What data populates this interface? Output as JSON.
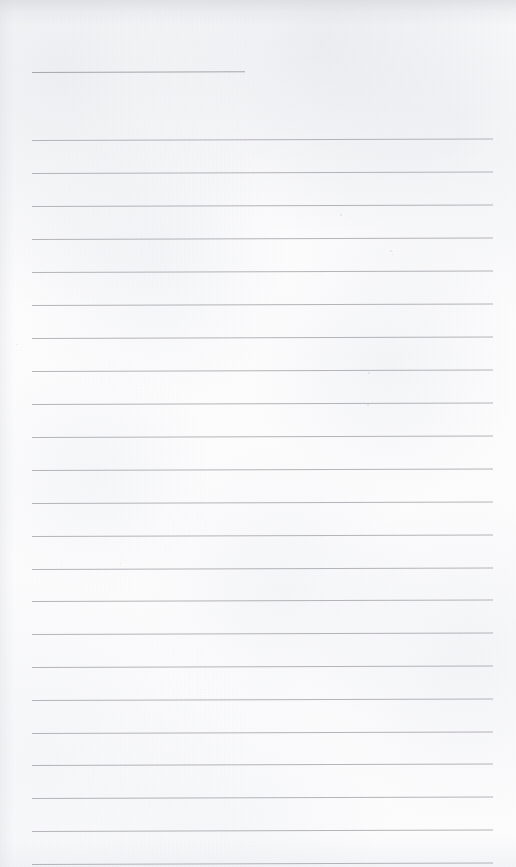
{
  "document": {
    "kind": "scanned-ruled-notepaper",
    "title": "",
    "visible_text": "",
    "text_content_present": false,
    "page_width": 516,
    "page_height": 867,
    "paper_color": "#fcfcfd",
    "rule_color": "#a8a8ad",
    "header_rule_color": "#9fa0a5",
    "scan_skew_px": -1.6
  },
  "rules": {
    "count": 24,
    "full_left_x": 32,
    "full_right_x": 493,
    "spacing_px": 33,
    "thickness_px": 1,
    "items": [
      {
        "index": 1,
        "y": 72,
        "x": 32,
        "width": 213,
        "kind": "header-rule",
        "label": ""
      },
      {
        "index": 2,
        "y": 140,
        "x": 32,
        "width": 461,
        "kind": "body-rule",
        "label": ""
      },
      {
        "index": 3,
        "y": 173,
        "x": 32,
        "width": 461,
        "kind": "body-rule",
        "label": ""
      },
      {
        "index": 4,
        "y": 206,
        "x": 32,
        "width": 461,
        "kind": "body-rule",
        "label": ""
      },
      {
        "index": 5,
        "y": 239,
        "x": 32,
        "width": 461,
        "kind": "body-rule",
        "label": ""
      },
      {
        "index": 6,
        "y": 272,
        "x": 32,
        "width": 461,
        "kind": "body-rule",
        "label": ""
      },
      {
        "index": 7,
        "y": 305,
        "x": 32,
        "width": 461,
        "kind": "body-rule",
        "label": ""
      },
      {
        "index": 8,
        "y": 338,
        "x": 32,
        "width": 461,
        "kind": "body-rule",
        "label": ""
      },
      {
        "index": 9,
        "y": 371,
        "x": 32,
        "width": 461,
        "kind": "body-rule",
        "label": ""
      },
      {
        "index": 10,
        "y": 404,
        "x": 32,
        "width": 461,
        "kind": "body-rule",
        "label": ""
      },
      {
        "index": 11,
        "y": 437,
        "x": 32,
        "width": 461,
        "kind": "body-rule",
        "label": ""
      },
      {
        "index": 12,
        "y": 470,
        "x": 32,
        "width": 461,
        "kind": "body-rule",
        "label": ""
      },
      {
        "index": 13,
        "y": 503,
        "x": 32,
        "width": 461,
        "kind": "body-rule",
        "label": ""
      },
      {
        "index": 14,
        "y": 536,
        "x": 32,
        "width": 461,
        "kind": "body-rule",
        "label": ""
      },
      {
        "index": 15,
        "y": 569,
        "x": 32,
        "width": 461,
        "kind": "body-rule",
        "label": ""
      },
      {
        "index": 16,
        "y": 601,
        "x": 32,
        "width": 461,
        "kind": "body-rule",
        "label": ""
      },
      {
        "index": 17,
        "y": 634,
        "x": 32,
        "width": 461,
        "kind": "body-rule",
        "label": ""
      },
      {
        "index": 18,
        "y": 667,
        "x": 32,
        "width": 461,
        "kind": "body-rule",
        "label": ""
      },
      {
        "index": 19,
        "y": 700,
        "x": 32,
        "width": 461,
        "kind": "body-rule",
        "label": ""
      },
      {
        "index": 20,
        "y": 733,
        "x": 32,
        "width": 461,
        "kind": "body-rule",
        "label": ""
      },
      {
        "index": 21,
        "y": 765,
        "x": 32,
        "width": 461,
        "kind": "body-rule",
        "label": ""
      },
      {
        "index": 22,
        "y": 798,
        "x": 32,
        "width": 461,
        "kind": "body-rule",
        "label": ""
      },
      {
        "index": 23,
        "y": 831,
        "x": 32,
        "width": 461,
        "kind": "body-rule",
        "label": ""
      },
      {
        "index": 24,
        "y": 864,
        "x": 32,
        "width": 461,
        "kind": "body-rule",
        "label": ""
      }
    ]
  },
  "specks": [
    {
      "x": 340,
      "y": 214,
      "size": 2
    },
    {
      "x": 350,
      "y": 216,
      "size": 1
    },
    {
      "x": 390,
      "y": 250,
      "size": 2
    },
    {
      "x": 392,
      "y": 254,
      "size": 1
    },
    {
      "x": 368,
      "y": 372,
      "size": 2
    },
    {
      "x": 367,
      "y": 404,
      "size": 2
    },
    {
      "x": 16,
      "y": 344,
      "size": 1
    },
    {
      "x": 120,
      "y": 563,
      "size": 1
    },
    {
      "x": 459,
      "y": 636,
      "size": 1
    }
  ]
}
